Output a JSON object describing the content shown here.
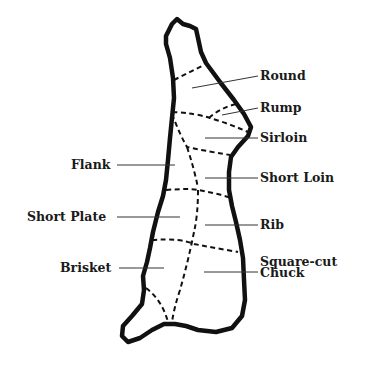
{
  "diagram": {
    "colors": {
      "outline": "#111111",
      "dashed": "#111111",
      "leader": "#333333",
      "text": "#1a1a1a",
      "background": "#ffffff"
    },
    "labels_right": [
      {
        "id": "round",
        "text": "Round"
      },
      {
        "id": "rump",
        "text": "Rump"
      },
      {
        "id": "sirloin",
        "text": "Sirloin"
      },
      {
        "id": "short-loin",
        "text": "Short Loin"
      },
      {
        "id": "rib",
        "text": "Rib"
      },
      {
        "id": "square-cut-chuck-1",
        "text": "Square-cut"
      },
      {
        "id": "square-cut-chuck-2",
        "text": "Chuck"
      }
    ],
    "labels_left": [
      {
        "id": "flank",
        "text": "Flank"
      },
      {
        "id": "short-plate",
        "text": "Short Plate"
      },
      {
        "id": "brisket",
        "text": "Brisket"
      }
    ]
  }
}
